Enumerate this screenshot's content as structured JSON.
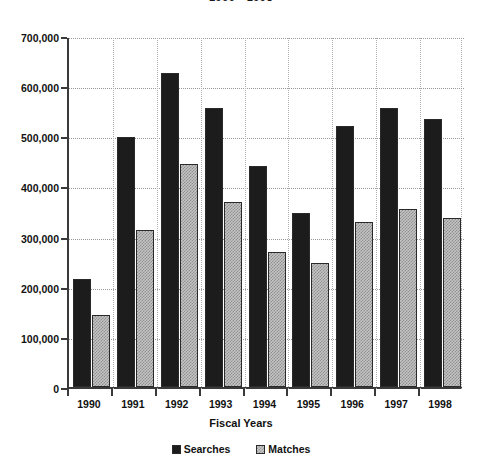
{
  "chart_data": {
    "type": "bar",
    "title": "1990 - 1998",
    "xlabel": "Fiscal Years",
    "ylabel": "",
    "categories": [
      "1990",
      "1991",
      "1992",
      "1993",
      "1994",
      "1995",
      "1996",
      "1997",
      "1998"
    ],
    "series": [
      {
        "name": "Searches",
        "color": "#1c1c1c",
        "values": [
          215000,
          499000,
          627000,
          557000,
          440000,
          348000,
          520000,
          557000,
          535000
        ]
      },
      {
        "name": "Matches",
        "color": "#c4c4c4",
        "values": [
          143000,
          313000,
          445000,
          368000,
          270000,
          247000,
          330000,
          355000,
          337000
        ]
      }
    ],
    "ylim": [
      0,
      700000
    ],
    "ytick_values": [
      0,
      100000,
      200000,
      300000,
      400000,
      500000,
      600000,
      700000
    ],
    "ytick_labels": [
      "0",
      "100,000",
      "200,000",
      "300,000",
      "400,000",
      "500,000",
      "600,000",
      "700,000"
    ],
    "grid": true,
    "legend_position": "bottom"
  },
  "legend": {
    "items": [
      {
        "label": "Searches",
        "swatch": "black-square-icon"
      },
      {
        "label": "Matches",
        "swatch": "gray-square-icon"
      }
    ]
  }
}
